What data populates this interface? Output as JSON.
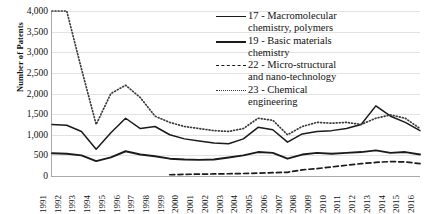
{
  "chart_data": {
    "type": "line",
    "title": "",
    "xlabel": "",
    "ylabel": "Number of Patents",
    "ylim": [
      0,
      4000
    ],
    "ytick_step": 500,
    "grid": true,
    "legend_position": "inside-top-right",
    "categories": [
      "1991",
      "1992",
      "1993",
      "1994",
      "1995",
      "1996",
      "1997",
      "1998",
      "1999",
      "2000",
      "2001",
      "2002",
      "2003",
      "2004",
      "2005",
      "2006",
      "2007",
      "2008",
      "2009",
      "2010",
      "2011",
      "2012",
      "2013",
      "2014",
      "2015",
      "2016"
    ],
    "series": [
      {
        "name": "17 - Macromolecular chemistry, polymers",
        "style": "solid",
        "color": "#1a1a1a",
        "values": [
          1250,
          1230,
          1080,
          650,
          1050,
          1400,
          1150,
          1200,
          1000,
          900,
          850,
          800,
          780,
          900,
          1180,
          1120,
          820,
          1020,
          1080,
          1100,
          1150,
          1250,
          1700,
          1450,
          1300,
          1100
        ]
      },
      {
        "name": "19 - Basic materials chemistry",
        "style": "solid",
        "color": "#1a1a1a",
        "values": [
          550,
          540,
          500,
          360,
          450,
          600,
          520,
          480,
          420,
          400,
          390,
          400,
          450,
          500,
          580,
          560,
          420,
          520,
          560,
          540,
          560,
          580,
          620,
          560,
          580,
          520
        ]
      },
      {
        "name": "22 - Micro-structural and nano-technology",
        "style": "dashed",
        "color": "#1a1a1a",
        "values": [
          null,
          null,
          null,
          null,
          null,
          null,
          null,
          null,
          30,
          40,
          45,
          50,
          55,
          60,
          70,
          80,
          90,
          150,
          180,
          220,
          260,
          300,
          330,
          350,
          340,
          300
        ]
      },
      {
        "name": "23 - Chemical engineering",
        "style": "dotted",
        "color": "#3a3a3a",
        "values": [
          4000,
          4000,
          2600,
          1250,
          2000,
          2200,
          1900,
          1450,
          1300,
          1200,
          1150,
          1100,
          1080,
          1150,
          1400,
          1350,
          1000,
          1200,
          1300,
          1280,
          1300,
          1250,
          1400,
          1480,
          1400,
          1150
        ]
      }
    ]
  },
  "legend": {
    "entries": [
      {
        "key": "solid-thin",
        "line1": "17 - Macromolecular",
        "line2": "chemistry, polymers"
      },
      {
        "key": "solid-thick",
        "line1": "19 - Basic materials",
        "line2": "chemistry"
      },
      {
        "key": "dashed",
        "line1": "22 - Micro-structural",
        "line2": "and nano-technology"
      },
      {
        "key": "dotted",
        "line1": "23 - Chemical",
        "line2": "engineering"
      }
    ]
  },
  "axis": {
    "y_title": "Number of Patents",
    "y_ticks": [
      "4,000",
      "3,500",
      "3,000",
      "2,500",
      "2,000",
      "1,500",
      "1,000",
      "500",
      "0"
    ]
  }
}
